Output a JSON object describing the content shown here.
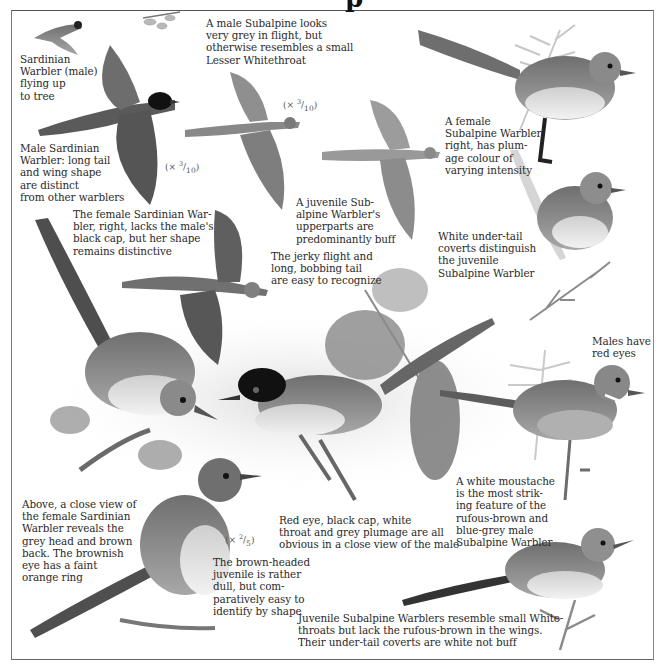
{
  "page": {
    "title_fragment": "p",
    "theme_colors": {
      "background": "#ffffff",
      "ink": "#2a2a2a",
      "frame": "#666666",
      "bird_grey": "#7a7a7a",
      "bird_dark": "#3a3a3a",
      "cap_black": "#111111",
      "foliage": "#9a9a9a"
    }
  },
  "captions": [
    {
      "id": "sardinian-male-flying",
      "text": "Sardinian\nWarbler (male)\nflying up\nto tree"
    },
    {
      "id": "male-subalpine-flight",
      "text": "A male Subalpine looks\nvery grey in flight, but\notherwise resembles a small\nLesser Whitethroat"
    },
    {
      "id": "male-sardinian-shape",
      "text": "Male Sardinian\nWarbler: long tail\nand wing shape\nare distinct\nfrom other warblers"
    },
    {
      "id": "female-subalpine",
      "text": "A female\nSubalpine Warbler,\nright, has plum-\nage colour of\nvarying intensity"
    },
    {
      "id": "juvenile-subalpine-buff",
      "text": "A juvenile Sub-\nalpine Warbler's\nupperparts are\npredominantly buff"
    },
    {
      "id": "female-sardinian",
      "text": "The female Sardinian War-\nbler, right, lacks the male's\nblack cap, but her shape\nremains distinctive"
    },
    {
      "id": "jerky-flight",
      "text": "The jerky flight and\nlong, bobbing tail\nare easy to recognize"
    },
    {
      "id": "under-tail-coverts",
      "text": "White under-tail\ncoverts distinguish\nthe juvenile\nSubalpine Warbler"
    },
    {
      "id": "red-eyes",
      "text": "Males have\nred eyes"
    },
    {
      "id": "white-moustache",
      "text": "A white moustache\nis the most strik-\ning feature of the\nrufous-brown and\nblue-grey male\nSubalpine Warbler"
    },
    {
      "id": "female-sardinian-closeup",
      "text": "Above, a close view of\nthe female Sardinian\nWarbler reveals the\ngrey head and brown\nback. The brownish\neye has a faint\norange ring"
    },
    {
      "id": "male-sardinian-closeup",
      "text": "Red eye, black cap, white\nthroat and grey plumage are all\nobvious in a close view of the male"
    },
    {
      "id": "brown-headed-juvenile",
      "text": "The brown-headed\njuvenile is rather\ndull, but com-\nparatively easy to\nidentify by shape"
    },
    {
      "id": "juvenile-subalpine-whitethroat",
      "text": "Juvenile Subalpine Warblers resemble small White-\nthroats but lack the rufous-brown in the wings.\nTheir under-tail coverts are white not buff"
    }
  ],
  "scales": [
    {
      "id": "scale-1",
      "prefix": "(× ",
      "num": "3",
      "den": "10",
      "suffix": ")"
    },
    {
      "id": "scale-2",
      "prefix": "(× ",
      "num": "3",
      "den": "10",
      "suffix": ")"
    },
    {
      "id": "scale-3",
      "prefix": "(× ",
      "num": "2",
      "den": "5",
      "suffix": ")"
    }
  ],
  "illustrations": [
    "sardinian-male-flying-small-icon",
    "sardinian-male-flight-spread-icon",
    "subalpine-male-flight-icon",
    "subalpine-juvenile-flight-icon",
    "subalpine-female-perched-icon",
    "subalpine-juvenile-perched-icon",
    "sardinian-female-flight-icon",
    "sardinian-female-perched-icon",
    "sardinian-male-perched-icon",
    "subalpine-male-perched-icon",
    "sardinian-juvenile-perched-icon",
    "subalpine-juvenile-low-perched-icon"
  ]
}
